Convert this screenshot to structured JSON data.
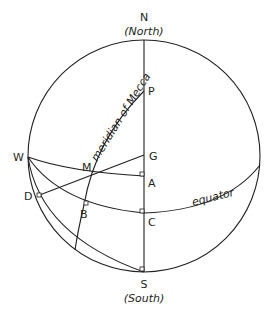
{
  "diagram": {
    "type": "celestial-sphere-qibla",
    "labels": {
      "north": "N",
      "north_sub": "(North)",
      "south": "S",
      "south_sub": "(South)",
      "west": "W",
      "P": "P",
      "G": "G",
      "M": "M",
      "A": "A",
      "D": "D",
      "B": "B",
      "C": "C",
      "meridian": "meridian of Mecca",
      "equator": "equator"
    },
    "colors": {
      "stroke": "#231f20",
      "background": "#ffffff"
    }
  }
}
